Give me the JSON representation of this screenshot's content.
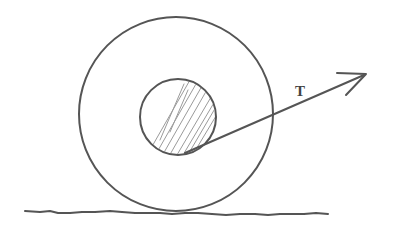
{
  "diagram": {
    "labels": {
      "tension": "T"
    },
    "colors": {
      "line": "#555555",
      "hatch": "#9a9a9a",
      "background": "#ffffff"
    },
    "outer_circle": {
      "cx": 176,
      "cy": 114,
      "r": 97
    },
    "inner_axle": {
      "cx": 178,
      "cy": 117,
      "r": 38,
      "shaded": true
    },
    "tension_vector": {
      "from": [
        185,
        153
      ],
      "to": [
        366,
        74
      ]
    },
    "ground": {
      "y": 212,
      "x_start": 25,
      "x_end": 328
    }
  }
}
